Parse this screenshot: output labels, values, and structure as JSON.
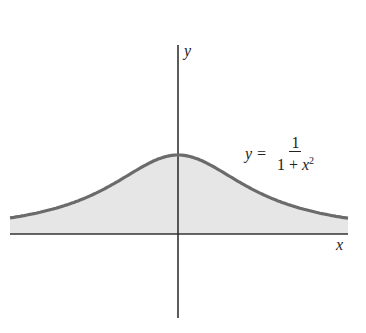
{
  "diagram": {
    "axes": {
      "x_label": "x",
      "y_label": "y"
    },
    "curve": {
      "equation_lhs": "y =",
      "numerator": "1",
      "denominator_prefix": "1 + ",
      "denominator_var": "x",
      "denominator_exp": "2",
      "stroke_color": "#6b6b6b",
      "fill_color": "#e6e6e6"
    },
    "colors": {
      "axis": "#333333",
      "background": "#ffffff"
    }
  }
}
